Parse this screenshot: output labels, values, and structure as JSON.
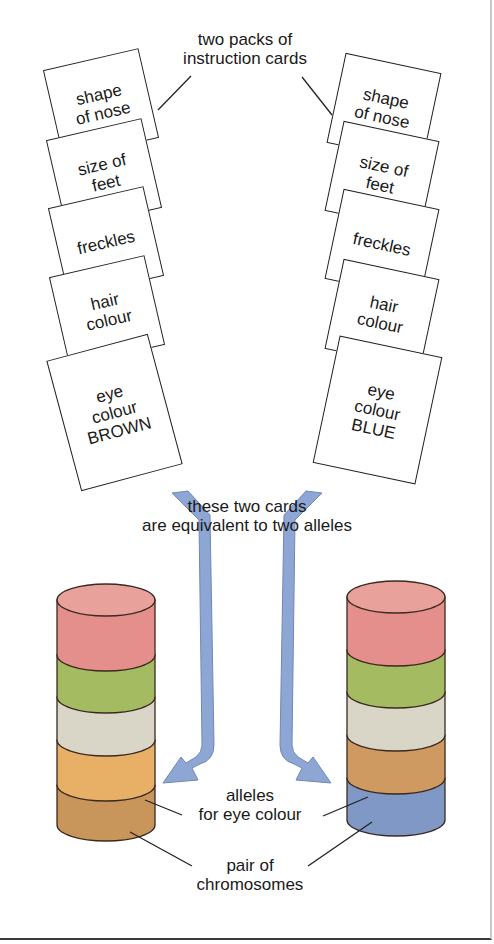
{
  "labels": {
    "packs": [
      "two packs of",
      "instruction cards"
    ],
    "equivalent": [
      "these two cards",
      "are equivalent to two alleles"
    ],
    "alleles": [
      "alleles",
      "for eye colour"
    ],
    "chromosomes": [
      "pair of",
      "chromosomes"
    ]
  },
  "left_pack": {
    "cards": [
      {
        "lines": [
          "shape",
          "of nose"
        ]
      },
      {
        "lines": [
          "size of",
          "feet"
        ]
      },
      {
        "lines": [
          "freckles"
        ]
      },
      {
        "lines": [
          "hair",
          "colour"
        ]
      },
      {
        "lines": [
          "eye",
          "colour",
          "BROWN"
        ]
      }
    ]
  },
  "right_pack": {
    "cards": [
      {
        "lines": [
          "shape",
          "of nose"
        ]
      },
      {
        "lines": [
          "size of",
          "feet"
        ]
      },
      {
        "lines": [
          "freckles"
        ]
      },
      {
        "lines": [
          "hair",
          "colour"
        ]
      },
      {
        "lines": [
          "eye",
          "colour",
          "BLUE"
        ]
      }
    ]
  },
  "colors": {
    "band_red": "#e48f8c",
    "band_green": "#a4bb62",
    "band_grey": "#d9d6c8",
    "band_orange": "#e8b067",
    "band_brown": "#c8955a",
    "band_tan": "#cf9a62",
    "band_blue": "#7f98c6",
    "arrow_blue": "#8ea6d3"
  }
}
